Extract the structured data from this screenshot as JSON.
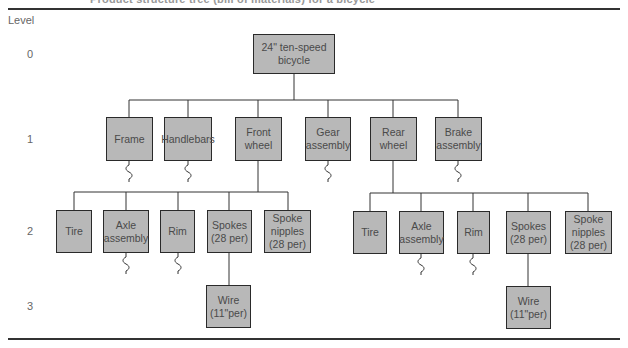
{
  "caption": "Product structure tree (bill of materials) for a bicycle",
  "level_header": "Level",
  "levels": [
    "0",
    "1",
    "2",
    "3"
  ],
  "nodes": {
    "root": "24\" ten-speed\nbicycle",
    "frame": "Frame",
    "handlebars": "Handlebars",
    "front_wheel": "Front\nwheel",
    "gear_assembly": "Gear\nassembly",
    "rear_wheel": "Rear\nwheel",
    "brake_assembly": "Brake\nassembly",
    "fw_tire": "Tire",
    "fw_axle": "Axle\nassembly",
    "fw_rim": "Rim",
    "fw_spokes": "Spokes\n(28 per)",
    "fw_nipples": "Spoke\nnipples\n(28 per)",
    "fw_wire": "Wire\n(11\"per)",
    "rw_tire": "Tire",
    "rw_axle": "Axle\nassembly",
    "rw_rim": "Rim",
    "rw_spokes": "Spokes\n(28 per)",
    "rw_nipples": "Spoke\nnipples\n(28 per)",
    "rw_wire": "Wire\n(11\"per)"
  },
  "colors": {
    "box_fill": "#b8b8b8",
    "box_border": "#2a2a2a",
    "line": "#333333"
  }
}
